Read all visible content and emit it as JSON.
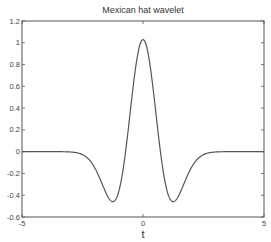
{
  "chart_data": {
    "type": "line",
    "title": "Mexican hat wavelet",
    "xlabel": "t",
    "ylabel": "",
    "xlim": [
      -5,
      5
    ],
    "ylim": [
      -0.6,
      1.2
    ],
    "xticks": [
      -5,
      0,
      5
    ],
    "yticks": [
      1.2,
      1,
      0.8,
      0.6,
      0.4,
      0.2,
      0,
      -0.2,
      -0.4,
      -0.6
    ],
    "grid": false,
    "legend": null,
    "series": [
      {
        "name": "Mexican hat wavelet",
        "formula": "1.03*(1-(t/0.72)^2)*exp(-(t/0.72)^2/2)",
        "x": [
          -5,
          -4,
          -3,
          -2.5,
          -2,
          -1.75,
          -1.5,
          -1.25,
          -1,
          -0.75,
          -0.5,
          -0.25,
          0,
          0.25,
          0.5,
          0.75,
          1,
          1.25,
          1.5,
          1.75,
          2,
          2.5,
          3,
          4,
          5
        ],
        "values": [
          0.0,
          0.0,
          -0.002,
          -0.03,
          -0.15,
          -0.25,
          -0.38,
          -0.46,
          -0.4,
          -0.05,
          0.45,
          0.87,
          1.03,
          0.87,
          0.45,
          -0.05,
          -0.4,
          -0.46,
          -0.38,
          -0.25,
          -0.15,
          -0.03,
          -0.002,
          0.0,
          0.0
        ],
        "color": "#555555"
      }
    ]
  },
  "plot": {
    "left": 22,
    "right": 264,
    "top": 21,
    "bottom": 217
  }
}
